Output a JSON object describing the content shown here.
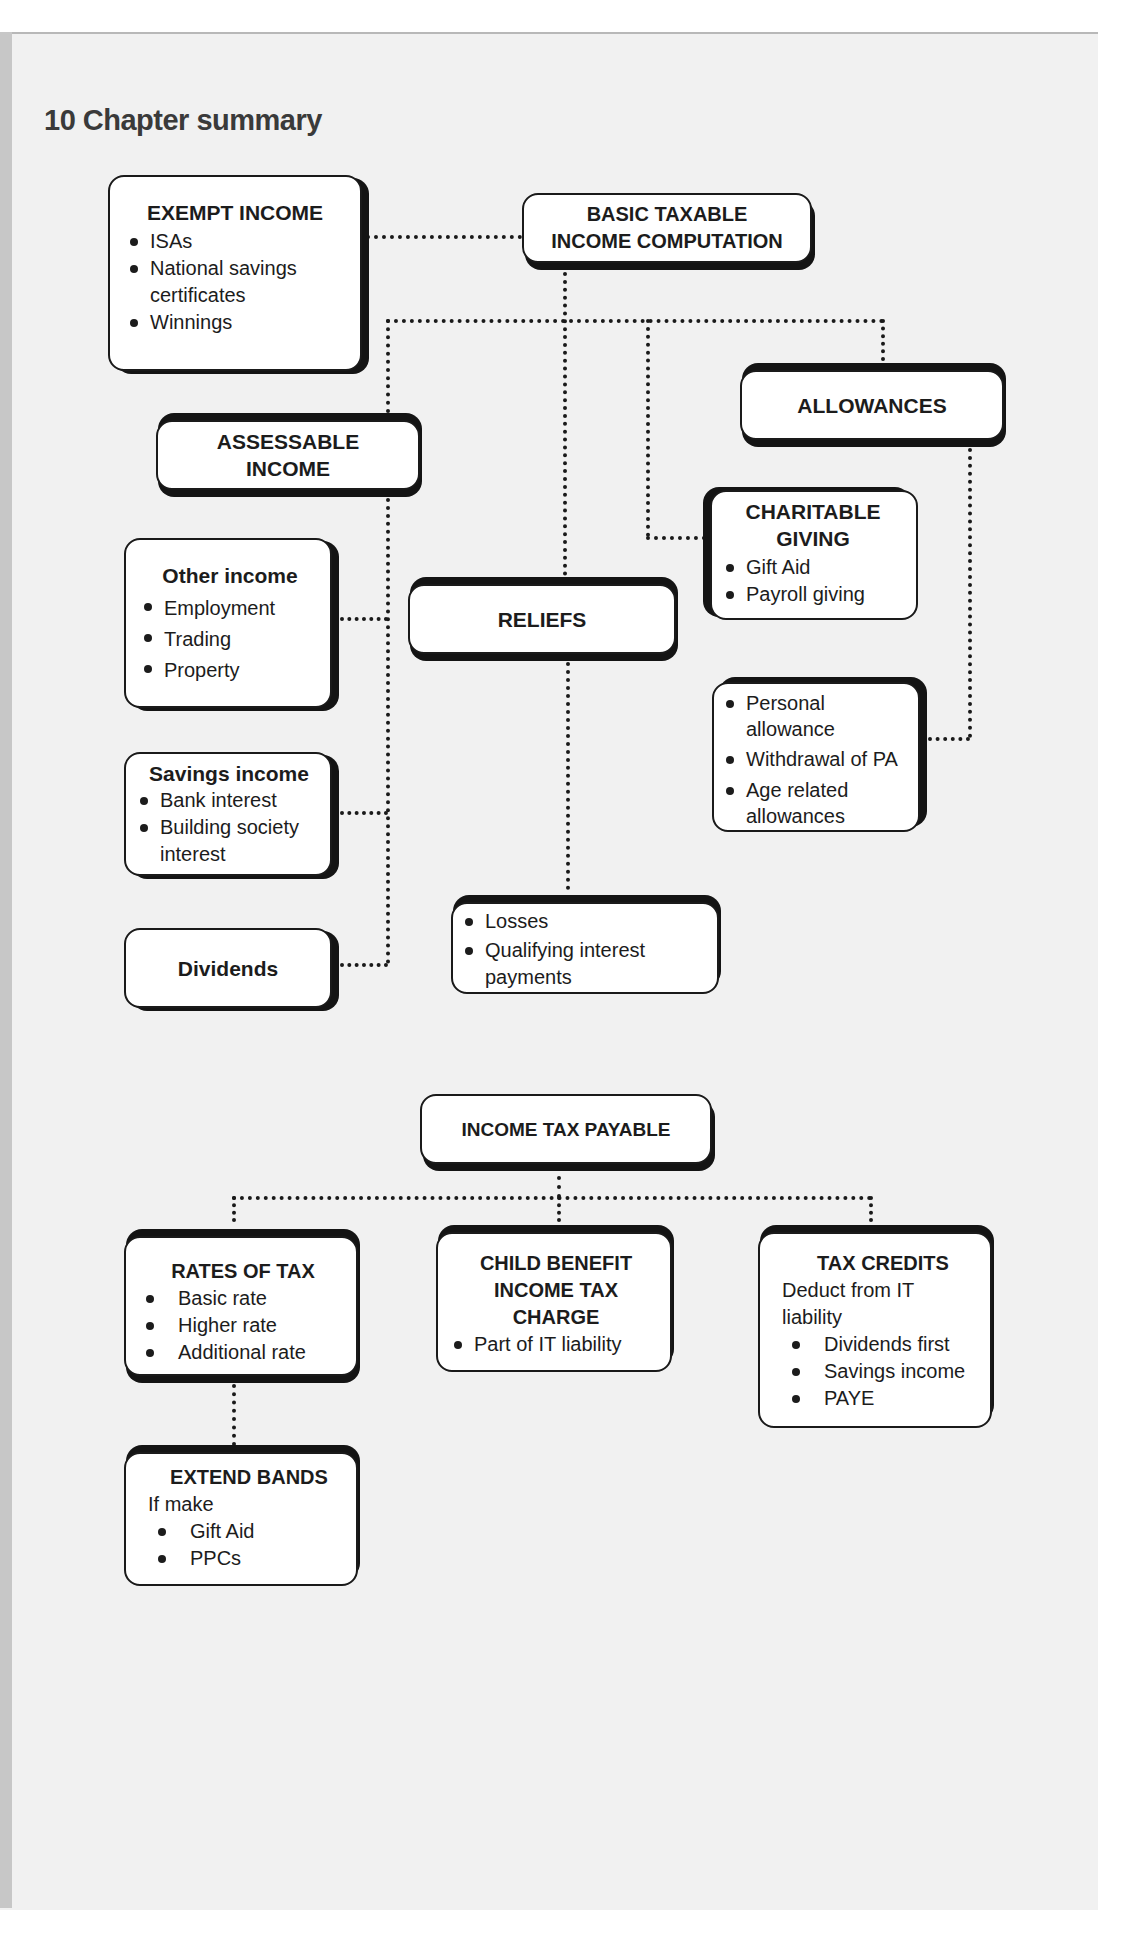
{
  "title": "10 Chapter summary",
  "diagram_top": {
    "exempt_income": {
      "heading": "EXEMPT INCOME",
      "items": [
        "ISAs",
        "National savings certificates",
        "Winnings"
      ]
    },
    "basic_taxable": {
      "heading_line1": "BASIC TAXABLE",
      "heading_line2": "INCOME COMPUTATION"
    },
    "assessable_income": {
      "heading_line1": "ASSESSABLE",
      "heading_line2": "INCOME"
    },
    "allowances": {
      "heading": "ALLOWANCES"
    },
    "charitable_giving": {
      "heading_line1": "CHARITABLE",
      "heading_line2": "GIVING",
      "items": [
        "Gift Aid",
        "Payroll giving"
      ]
    },
    "other_income": {
      "heading": "Other income",
      "items": [
        "Employment",
        "Trading",
        "Property"
      ]
    },
    "reliefs": {
      "heading": "RELIEFS"
    },
    "allowance_items": {
      "items": [
        "Personal allowance",
        "Withdrawal of PA",
        "Age related allowances"
      ]
    },
    "savings_income": {
      "heading": "Savings income",
      "items": [
        "Bank interest",
        "Building society interest"
      ]
    },
    "dividends": {
      "heading": "Dividends"
    },
    "relief_items": {
      "items": [
        "Losses",
        "Qualifying interest payments"
      ]
    }
  },
  "diagram_bottom": {
    "income_tax_payable": {
      "heading": "INCOME TAX PAYABLE"
    },
    "rates_of_tax": {
      "heading": "RATES OF TAX",
      "items": [
        "Basic rate",
        "Higher rate",
        "Additional rate"
      ]
    },
    "child_benefit": {
      "heading_line1": "CHILD BENEFIT",
      "heading_line2": "INCOME TAX",
      "heading_line3": "CHARGE",
      "items": [
        "Part of IT liability"
      ]
    },
    "tax_credits": {
      "heading": "TAX CREDITS",
      "intro": "Deduct from IT liability",
      "items": [
        "Dividends first",
        "Savings income",
        "PAYE"
      ]
    },
    "extend_bands": {
      "heading": "EXTEND BANDS",
      "intro": "If make",
      "items": [
        "Gift Aid",
        "PPCs"
      ]
    }
  }
}
